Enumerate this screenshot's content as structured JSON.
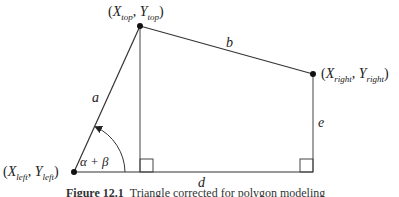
{
  "diagram": {
    "vertices": {
      "top": {
        "label_x": "X",
        "sub_x": "top",
        "label_y": "Y",
        "sub_y": "top"
      },
      "right": {
        "label_x": "X",
        "sub_x": "right",
        "label_y": "Y",
        "sub_y": "right"
      },
      "left": {
        "label_x": "X",
        "sub_x": "left",
        "label_y": "Y",
        "sub_y": "left"
      }
    },
    "edges": {
      "a": "a",
      "b": "b",
      "d": "d",
      "e": "e"
    },
    "angle_label": "α + β",
    "punct": {
      "open": "(",
      "comma": ", ",
      "close": ")"
    },
    "caption_bold": "Figure 12.1",
    "caption_text": "Triangle corrected for polygon modeling"
  }
}
